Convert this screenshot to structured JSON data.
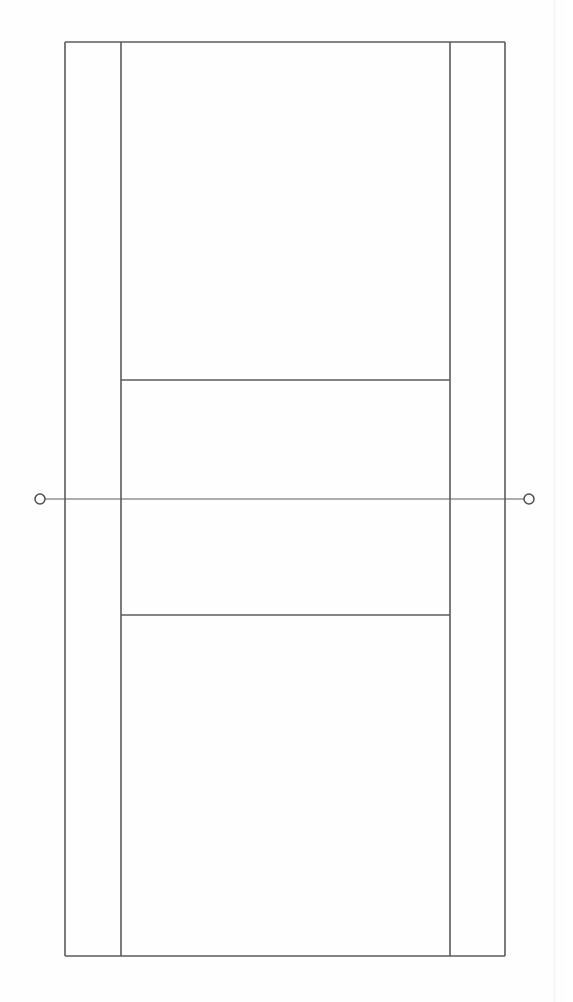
{
  "document": {
    "title": "Tennis Court Diagram",
    "description": "Top-down line drawing of a tennis court",
    "background_color": "#fefefe",
    "line_color": "#5b5b5f",
    "page_width": 573,
    "page_height": 1002
  },
  "chart_data": {
    "type": "diagram",
    "title": "Tennis Court Diagram",
    "subtitle": "",
    "view": "plan / overhead",
    "units": "pixels",
    "grid": false,
    "legend": null,
    "xlabel": "",
    "ylabel": "",
    "xlim": [
      0,
      573
    ],
    "ylim": [
      0,
      1002
    ],
    "court": {
      "doubles_court": {
        "left": 65,
        "right": 505,
        "top": 42,
        "bottom": 956,
        "width": 440,
        "height": 914
      },
      "singles_sidelines_x": [
        121,
        450
      ],
      "doubles_alley_width_left": 56,
      "doubles_alley_width_right": 55,
      "service_lines_y": [
        380,
        615
      ],
      "net_line_y": 499,
      "net_line_x_start": 45,
      "net_line_x_end": 524,
      "center_service_line": false,
      "center_marks": false
    },
    "elements": [
      {
        "name": "baseline-top",
        "type": "line",
        "x1": 65,
        "y1": 42,
        "x2": 505,
        "y2": 42
      },
      {
        "name": "baseline-bottom",
        "type": "line",
        "x1": 65,
        "y1": 956,
        "x2": 505,
        "y2": 956
      },
      {
        "name": "doubles-sideline-left",
        "type": "line",
        "x1": 65,
        "y1": 42,
        "x2": 65,
        "y2": 956
      },
      {
        "name": "doubles-sideline-right",
        "type": "line",
        "x1": 505,
        "y1": 42,
        "x2": 505,
        "y2": 956
      },
      {
        "name": "singles-sideline-left",
        "type": "line",
        "x1": 121,
        "y1": 42,
        "x2": 121,
        "y2": 956
      },
      {
        "name": "singles-sideline-right",
        "type": "line",
        "x1": 450,
        "y1": 42,
        "x2": 450,
        "y2": 956
      },
      {
        "name": "service-line-top",
        "type": "line",
        "x1": 121,
        "y1": 380,
        "x2": 450,
        "y2": 380
      },
      {
        "name": "service-line-bottom",
        "type": "line",
        "x1": 121,
        "y1": 615,
        "x2": 450,
        "y2": 615
      },
      {
        "name": "net-line",
        "type": "line",
        "x1": 45,
        "y1": 499,
        "x2": 524,
        "y2": 499
      },
      {
        "name": "net-post-left",
        "type": "circle",
        "cx": 40,
        "cy": 499,
        "r": 5
      },
      {
        "name": "net-post-right",
        "type": "circle",
        "cx": 529,
        "cy": 499,
        "r": 5
      }
    ],
    "regions": [
      {
        "name": "service-box-far",
        "top": 380,
        "bottom": 499,
        "left": 121,
        "right": 450
      },
      {
        "name": "service-box-near",
        "top": 499,
        "bottom": 615,
        "left": 121,
        "right": 450
      },
      {
        "name": "backcourt-far",
        "top": 42,
        "bottom": 380,
        "left": 121,
        "right": 450
      },
      {
        "name": "backcourt-near",
        "top": 615,
        "bottom": 956,
        "left": 121,
        "right": 450
      },
      {
        "name": "doubles-alley-left",
        "top": 42,
        "bottom": 956,
        "left": 65,
        "right": 121
      },
      {
        "name": "doubles-alley-right",
        "top": 42,
        "bottom": 956,
        "left": 450,
        "right": 505
      }
    ]
  }
}
